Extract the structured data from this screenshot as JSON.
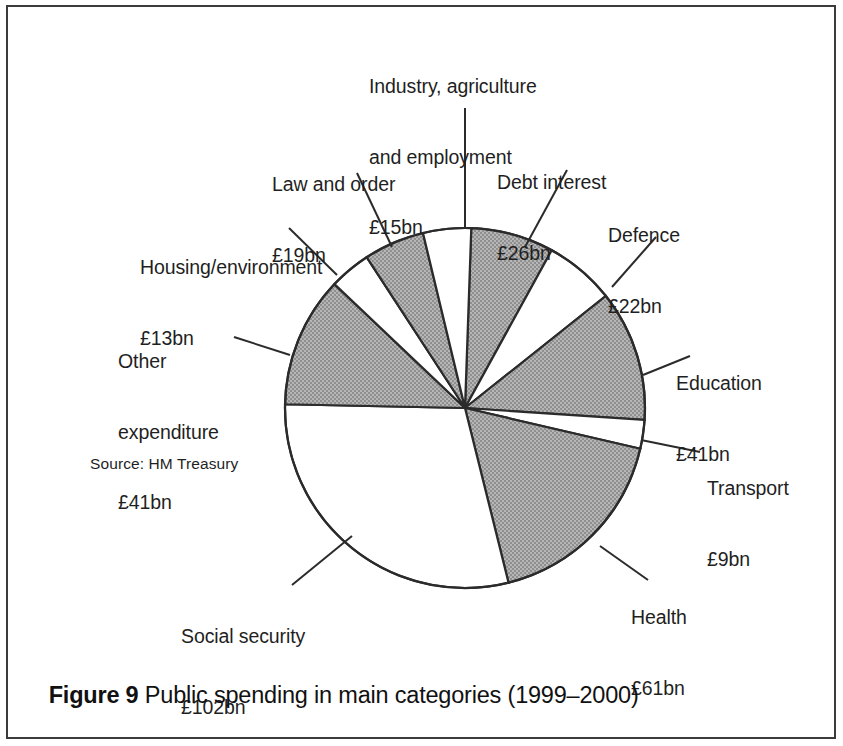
{
  "figure": {
    "caption_label": "Figure 9",
    "caption_text": " Public spending in main categories (1999–2000)",
    "source_note": "Source: HM Treasury"
  },
  "chart_data": {
    "type": "pie",
    "title": "Public spending in main categories (1999–2000)",
    "units": "£bn",
    "source": "Source: HM Treasury",
    "total": 349,
    "start_angle_deg": 2,
    "direction": "clockwise",
    "legend": "none (direct labels with leader lines)",
    "colors": {
      "shaded": "#a8a8a8",
      "unshaded": "#ffffff",
      "outline": "#2b2b2b"
    },
    "categories": [
      "Debt interest",
      "Defence",
      "Education",
      "Transport",
      "Health",
      "Social security",
      "Other expenditure",
      "Housing/environment",
      "Law and order",
      "Industry, agriculture and employment"
    ],
    "values": [
      26,
      22,
      41,
      9,
      61,
      102,
      41,
      13,
      19,
      15
    ],
    "slices": [
      {
        "name": "Debt interest",
        "label": "Debt interest",
        "value_label": "£26bn",
        "value": 26,
        "fill": "shaded",
        "start": 2.0,
        "end": 28.8
      },
      {
        "name": "Defence",
        "label": "Defence",
        "value_label": "£22bn",
        "value": 22,
        "fill": "unshaded",
        "start": 28.8,
        "end": 51.5
      },
      {
        "name": "Education",
        "label": "Education",
        "value_label": "£41bn",
        "value": 41,
        "fill": "shaded",
        "start": 51.5,
        "end": 93.8
      },
      {
        "name": "Transport",
        "label": "Transport",
        "value_label": "£9bn",
        "value": 9,
        "fill": "unshaded",
        "start": 93.8,
        "end": 103.1
      },
      {
        "name": "Health",
        "label": "Health",
        "value_label": "£61bn",
        "value": 61,
        "fill": "shaded",
        "start": 103.1,
        "end": 166.0
      },
      {
        "name": "Social security",
        "label": "Social security",
        "value_label": "£102bn",
        "value": 102,
        "fill": "unshaded",
        "start": 166.0,
        "end": 271.2
      },
      {
        "name": "Other expenditure",
        "label": "Other\nexpenditure",
        "value_label": "£41bn",
        "value": 41,
        "fill": "shaded",
        "start": 271.2,
        "end": 313.5
      },
      {
        "name": "Housing/environment",
        "label": "Housing/environment",
        "value_label": "£13bn",
        "value": 13,
        "fill": "unshaded",
        "start": 313.5,
        "end": 326.9
      },
      {
        "name": "Law and order",
        "label": "Law and order",
        "value_label": "£19bn",
        "value": 19,
        "fill": "shaded",
        "start": 326.9,
        "end": 346.5
      },
      {
        "name": "Industry, agriculture and employment",
        "label": "Industry, agriculture\nand employment",
        "value_label": "£15bn",
        "value": 15,
        "fill": "unshaded",
        "start": 346.5,
        "end": 362.0
      }
    ]
  },
  "labels": {
    "industry": {
      "line1": "Industry, agriculture",
      "line2": "and employment",
      "line3": "£15bn"
    },
    "debt": {
      "line1": "Debt interest",
      "line2": "£26bn"
    },
    "defence": {
      "line1": "Defence",
      "line2": "£22bn"
    },
    "education": {
      "line1": "Education",
      "line2": "£41bn"
    },
    "transport": {
      "line1": "Transport",
      "line2": "£9bn"
    },
    "health": {
      "line1": "Health",
      "line2": "£61bn"
    },
    "social": {
      "line1": "Social security",
      "line2": "£102bn"
    },
    "other": {
      "line1": "Other",
      "line2": "expenditure",
      "line3": "£41bn"
    },
    "housing": {
      "line1": "Housing/environment",
      "line2": "£13bn"
    },
    "law": {
      "line1": "Law and order",
      "line2": "£19bn"
    }
  }
}
